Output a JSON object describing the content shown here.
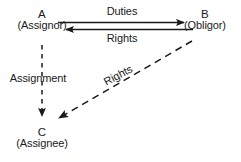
{
  "diagram": {
    "type": "assignment-relationship-diagram",
    "background_color": "#ffffff",
    "stroke_color": "#1a1a1a",
    "nodes": [
      {
        "id": "A",
        "letter": "A",
        "role": "(Assignor)",
        "x": 42,
        "y": 15
      },
      {
        "id": "B",
        "letter": "B",
        "role": "(Obligor)",
        "x": 205,
        "y": 15
      },
      {
        "id": "C",
        "letter": "C",
        "role": "(Assignee)",
        "x": 42,
        "y": 133
      }
    ],
    "edges": [
      {
        "id": "duties",
        "label": "Duties",
        "from": "A",
        "to": "B",
        "style": "solid",
        "direction": "right"
      },
      {
        "id": "rights-ab",
        "label": "Rights",
        "from": "B",
        "to": "A",
        "style": "solid",
        "direction": "left"
      },
      {
        "id": "assignment",
        "label": "Assignment",
        "from": "A",
        "to": "C",
        "style": "dashed",
        "direction": "down"
      },
      {
        "id": "rights-bc",
        "label": "Rights",
        "from": "B",
        "to": "C",
        "style": "dashed",
        "direction": "down-left",
        "label_rotation_deg": -28
      }
    ]
  }
}
